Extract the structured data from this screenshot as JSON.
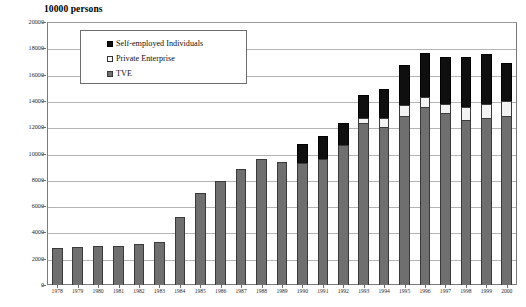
{
  "chart_data": {
    "type": "bar",
    "subtype": "stacked-vertical",
    "title": "10000 persons",
    "xlabel": "",
    "ylabel": "",
    "ylim": [
      0,
      20000
    ],
    "ytick_step": 2000,
    "yticks": [
      "0",
      "2000",
      "4000",
      "6000",
      "8000",
      "10000",
      "12000",
      "14000",
      "16000",
      "18000",
      "20000"
    ],
    "grid": true,
    "legend_position": "upper-left-inside",
    "categories": [
      "1978",
      "1979",
      "1980",
      "1981",
      "1982",
      "1983",
      "1984",
      "1985",
      "1986",
      "1987",
      "1988",
      "1989",
      "1990",
      "1991",
      "1992",
      "1993",
      "1994",
      "1995",
      "1996",
      "1997",
      "1998",
      "1999",
      "2000"
    ],
    "series": [
      {
        "name": "TVE",
        "color": "#6f6f6f",
        "values": [
          2827,
          2909,
          3000,
          2970,
          3113,
          3235,
          5208,
          6979,
          7937,
          8805,
          9545,
          9367,
          9265,
          9609,
          10625,
          12345,
          12017,
          12862,
          13508,
          13050,
          12537,
          12704,
          12820
        ]
      },
      {
        "name": "Private Enterprise",
        "color": "#f2f2f2",
        "values": [
          0,
          0,
          0,
          0,
          0,
          0,
          0,
          0,
          0,
          0,
          0,
          0,
          0,
          0,
          0,
          373,
          648,
          822,
          819,
          750,
          970,
          1053,
          1139
        ]
      },
      {
        "name": "Self-employed Individuals",
        "color": "#100f0f",
        "values": [
          0,
          0,
          0,
          0,
          0,
          0,
          0,
          0,
          0,
          0,
          0,
          0,
          1491,
          1713,
          1728,
          1766,
          2254,
          3054,
          3308,
          3522,
          3855,
          3827,
          2934
        ]
      }
    ],
    "totals": [
      2827,
      2909,
      3000,
      2970,
      3113,
      3235,
      5208,
      6979,
      7937,
      8805,
      9545,
      9367,
      10756,
      11322,
      12353,
      14484,
      14919,
      16738,
      17635,
      17322,
      17362,
      17584,
      16893
    ]
  },
  "legend": {
    "items": [
      {
        "label": "Self-employed Individuals",
        "swatch": "swatch-black"
      },
      {
        "label": "Private Enterprise",
        "swatch": "swatch-white"
      },
      {
        "label": "TVE",
        "swatch": "swatch-gray"
      }
    ]
  }
}
